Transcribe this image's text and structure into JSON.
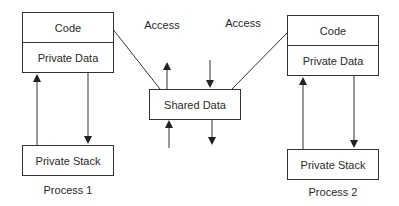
{
  "diagram": {
    "process1": {
      "code_label": "Code",
      "private_data_label": "Private Data",
      "private_stack_label": "Private Stack",
      "name": "Process 1"
    },
    "process2": {
      "code_label": "Code",
      "private_data_label": "Private Data",
      "private_stack_label": "Private Stack",
      "name": "Process 2"
    },
    "shared": {
      "label": "Shared Data"
    },
    "access_labels": [
      "Access",
      "Access"
    ],
    "colors": {
      "stroke": "#333333",
      "text": "#2a2a2a",
      "background": "#ffffff"
    }
  }
}
